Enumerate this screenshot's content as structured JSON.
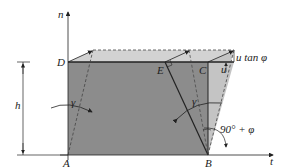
{
  "diagram": {
    "type": "shear-deformation-schematic",
    "axes": {
      "vertical": "n",
      "horizontal": "t"
    },
    "points": {
      "D": "D",
      "E": "E",
      "C": "C",
      "A": "A",
      "B": "B"
    },
    "dimension": {
      "height": "h"
    },
    "annotations": {
      "u_tan_phi": "u tan φ",
      "u": "u",
      "gamma_left": "γ",
      "gamma_right": "γ",
      "angle_B": "90° + φ"
    },
    "colors": {
      "dark_fill": "#8c8c8c",
      "light_fill": "#c4c4c4",
      "top_band": "#d2d2d2",
      "line": "#222222",
      "background": "#ffffff"
    }
  }
}
